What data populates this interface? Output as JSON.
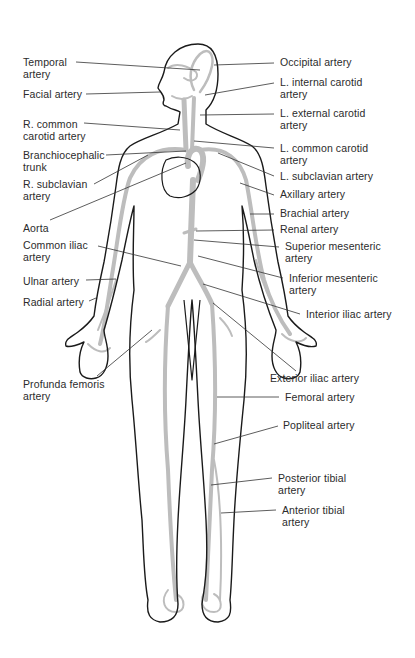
{
  "diagram": {
    "type": "anatomical-diagram",
    "colors": {
      "outline": "#1a1a1a",
      "artery": "#bdbdbd",
      "leader": "#333333",
      "text": "#2b2b2b",
      "background": "#ffffff"
    },
    "labels_left": [
      {
        "id": "temporal",
        "line1": "Temporal",
        "line2": "artery",
        "x": 23,
        "y": 57,
        "lx1": 76,
        "ly1": 62,
        "lx2": 200,
        "ly2": 70
      },
      {
        "id": "facial",
        "line1": "Facial artery",
        "line2": "",
        "x": 23,
        "y": 89,
        "lx1": 86,
        "ly1": 94,
        "lx2": 160,
        "ly2": 92
      },
      {
        "id": "r-common-carotid",
        "line1": "R. common",
        "line2": "carotid artery",
        "x": 23,
        "y": 119,
        "lx1": 84,
        "ly1": 123,
        "lx2": 180,
        "ly2": 130
      },
      {
        "id": "brachiocephalic",
        "line1": "Branchiocephalic",
        "line2": "trunk",
        "x": 23,
        "y": 150,
        "lx1": 106,
        "ly1": 155,
        "lx2": 186,
        "ly2": 151
      },
      {
        "id": "r-subclavian",
        "line1": "R. subclavian",
        "line2": "artery",
        "x": 23,
        "y": 179,
        "lx1": 94,
        "ly1": 184,
        "lx2": 148,
        "ly2": 155
      },
      {
        "id": "aorta",
        "line1": "Aorta",
        "line2": "",
        "x": 23,
        "y": 223,
        "lx1": 50,
        "ly1": 220,
        "lx2": 186,
        "ly2": 163
      },
      {
        "id": "common-iliac",
        "line1": "Common iliac",
        "line2": "artery",
        "x": 23,
        "y": 240,
        "lx1": 98,
        "ly1": 246,
        "lx2": 181,
        "ly2": 266
      },
      {
        "id": "ulnar",
        "line1": "Ulnar artery",
        "line2": "",
        "x": 23,
        "y": 276,
        "lx1": 86,
        "ly1": 280,
        "lx2": 116,
        "ly2": 279
      },
      {
        "id": "radial",
        "line1": "Radial artery",
        "line2": "",
        "x": 23,
        "y": 297,
        "lx1": 89,
        "ly1": 301,
        "lx2": 96,
        "ly2": 298
      },
      {
        "id": "profunda-femoris",
        "line1": "Profunda femoris",
        "line2": "artery",
        "x": 23,
        "y": 379,
        "lx1": 97,
        "ly1": 376,
        "lx2": 152,
        "ly2": 330
      }
    ],
    "labels_right": [
      {
        "id": "occipital",
        "line1": "Occipital artery",
        "line2": "",
        "x": 280,
        "y": 57,
        "lx1": 274,
        "ly1": 63,
        "lx2": 214,
        "ly2": 65
      },
      {
        "id": "l-internal-carotid",
        "line1": "L. internal carotid",
        "line2": "artery",
        "x": 280,
        "y": 77,
        "lx1": 274,
        "ly1": 83,
        "lx2": 205,
        "ly2": 95
      },
      {
        "id": "l-external-carotid",
        "line1": "L. external carotid",
        "line2": "artery",
        "x": 280,
        "y": 108,
        "lx1": 274,
        "ly1": 114,
        "lx2": 200,
        "ly2": 115
      },
      {
        "id": "l-common-carotid",
        "line1": "L. common carotid",
        "line2": "artery",
        "x": 280,
        "y": 143,
        "lx1": 274,
        "ly1": 148,
        "lx2": 194,
        "ly2": 141
      },
      {
        "id": "l-subclavian",
        "line1": "L. subclavian artery",
        "line2": "",
        "x": 280,
        "y": 171,
        "lx1": 274,
        "ly1": 176,
        "lx2": 218,
        "ly2": 153
      },
      {
        "id": "axillary",
        "line1": "Axillary artery",
        "line2": "",
        "x": 280,
        "y": 189,
        "lx1": 274,
        "ly1": 195,
        "lx2": 240,
        "ly2": 183
      },
      {
        "id": "brachial",
        "line1": "Brachial artery",
        "line2": "",
        "x": 280,
        "y": 208,
        "lx1": 274,
        "ly1": 214,
        "lx2": 250,
        "ly2": 214
      },
      {
        "id": "renal",
        "line1": "Renal artery",
        "line2": "",
        "x": 280,
        "y": 224,
        "lx1": 274,
        "ly1": 230,
        "lx2": 196,
        "ly2": 231
      },
      {
        "id": "superior-mesenteric",
        "line1": "Superior mesenteric",
        "line2": "artery",
        "x": 285,
        "y": 241,
        "lx1": 279,
        "ly1": 247,
        "lx2": 194,
        "ly2": 240
      },
      {
        "id": "inferior-mesenteric",
        "line1": "Inferior mesenteric",
        "line2": "artery",
        "x": 289,
        "y": 273,
        "lx1": 283,
        "ly1": 278,
        "lx2": 198,
        "ly2": 256
      },
      {
        "id": "interior-iliac",
        "line1": "Interior iliac artery",
        "line2": "",
        "x": 306,
        "y": 309,
        "lx1": 300,
        "ly1": 314,
        "lx2": 203,
        "ly2": 284
      },
      {
        "id": "exterior-iliac",
        "line1": "Exterior iliac artery",
        "line2": "",
        "x": 270,
        "y": 373,
        "lx1": 296,
        "ly1": 371,
        "lx2": 213,
        "ly2": 303
      },
      {
        "id": "femoral",
        "line1": "Femoral artery",
        "line2": "",
        "x": 285,
        "y": 392,
        "lx1": 279,
        "ly1": 397,
        "lx2": 217,
        "ly2": 397
      },
      {
        "id": "popliteal",
        "line1": "Popliteal artery",
        "line2": "",
        "x": 283,
        "y": 420,
        "lx1": 278,
        "ly1": 426,
        "lx2": 214,
        "ly2": 444
      },
      {
        "id": "posterior-tibial",
        "line1": "Posterior tibial",
        "line2": "artery",
        "x": 278,
        "y": 473,
        "lx1": 272,
        "ly1": 478,
        "lx2": 211,
        "ly2": 485
      },
      {
        "id": "anterior-tibial",
        "line1": "Anterior tibial",
        "line2": "artery",
        "x": 282,
        "y": 505,
        "lx1": 276,
        "ly1": 510,
        "lx2": 221,
        "ly2": 513
      }
    ]
  }
}
